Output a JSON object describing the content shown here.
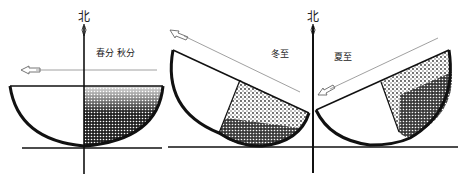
{
  "diagram": {
    "north_label": "北",
    "panels": [
      {
        "id": "equinox",
        "label": "春分 秋分"
      },
      {
        "id": "winter",
        "label": "冬至"
      },
      {
        "id": "summer",
        "label": "夏至"
      }
    ]
  },
  "colors": {
    "ink": "#111111",
    "arrow": "#777777",
    "background": "#ffffff"
  }
}
